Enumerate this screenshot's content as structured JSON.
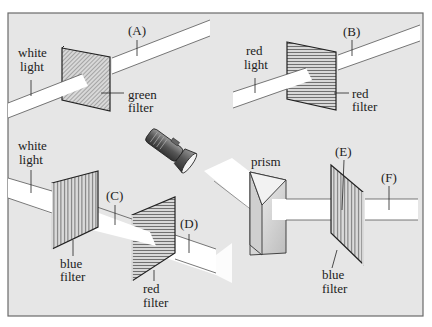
{
  "diagram": {
    "colors": {
      "panel_bg": "#e6e6e6",
      "panel_border": "#6a6a6a",
      "beam": "#ffffff",
      "beam_edge": "#555555",
      "filter_fill": "#d6d6d6",
      "filter_edge": "#222222"
    },
    "scenes": [
      {
        "id": "scene-1",
        "beam_in_label": [
          "white",
          "light"
        ],
        "filter_label": [
          "green",
          "filter"
        ],
        "output_marker": "(A)"
      },
      {
        "id": "scene-2",
        "beam_in_label": [
          "red",
          "light"
        ],
        "filter_label": [
          "red",
          "filter"
        ],
        "output_marker": "(B)"
      },
      {
        "id": "scene-3",
        "beam_in_label": [
          "white",
          "light"
        ],
        "filter_1_label": [
          "blue",
          "filter"
        ],
        "between_marker": "(C)",
        "filter_2_label": [
          "red",
          "filter"
        ],
        "output_marker": "(D)"
      },
      {
        "id": "scene-4",
        "source": "flashlight",
        "prism_label": "prism",
        "filter_label": [
          "blue",
          "filter"
        ],
        "inside_marker": "(E)",
        "output_marker": "(F)"
      }
    ]
  }
}
